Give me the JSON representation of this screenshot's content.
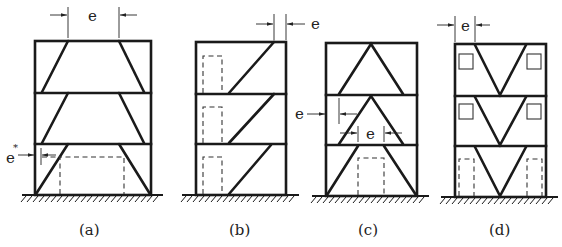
{
  "figure": {
    "panels": [
      {
        "id": "a",
        "caption": "(a)",
        "dimension_labels": [
          "e",
          "e*"
        ]
      },
      {
        "id": "b",
        "caption": "(b)",
        "dimension_labels": [
          "e"
        ]
      },
      {
        "id": "c",
        "caption": "(c)",
        "dimension_labels": [
          "e",
          "e"
        ]
      },
      {
        "id": "d",
        "caption": "(d)",
        "dimension_labels": [
          "e"
        ]
      }
    ]
  },
  "labels": {
    "a_e": "e",
    "a_estar_base": "e",
    "a_estar_sup": "*",
    "b_e": "e",
    "c_e_left": "e",
    "c_e_mid": "e",
    "d_e": "e"
  },
  "captions": {
    "a": "(a)",
    "b": "(b)",
    "c": "(c)",
    "d": "(d)"
  }
}
